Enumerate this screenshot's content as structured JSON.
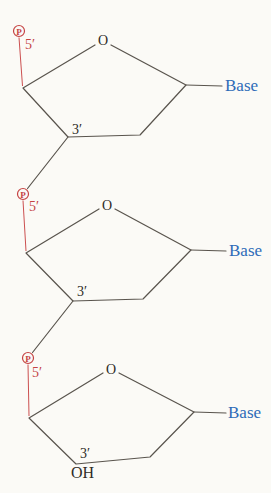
{
  "figure": {
    "colors": {
      "phosphate_red": "#c54343",
      "base_blue": "#2e6bb8",
      "bond_gray": "#59544d",
      "label_dark": "#2e2b27",
      "background": "#fbfaf6"
    },
    "units": [
      {
        "phosphate": "P",
        "five_prime": "5′",
        "ring_oxygen": "O",
        "three_prime": "3′",
        "base": "Base"
      },
      {
        "phosphate": "P",
        "five_prime": "5′",
        "ring_oxygen": "O",
        "three_prime": "3′",
        "base": "Base"
      },
      {
        "phosphate": "P",
        "five_prime": "5′",
        "ring_oxygen": "O",
        "three_prime": "3′",
        "base": "Base",
        "hydroxyl": "OH"
      }
    ]
  }
}
